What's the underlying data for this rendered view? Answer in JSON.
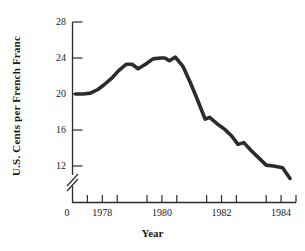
{
  "chart_data": {
    "type": "line",
    "title": "",
    "subtitle": "",
    "xlabel": "Year",
    "ylabel": "U.S. Cents per French Franc",
    "grid": false,
    "legend": null,
    "axis_break": true,
    "axis_break_note": "y-axis broken between 0 and 12",
    "xlim": [
      1977.0,
      1984.5
    ],
    "ylim": [
      10.0,
      28.0
    ],
    "y_ticks": [
      28,
      24,
      20,
      16,
      12
    ],
    "y_tick_labels": [
      "28",
      "24",
      "20",
      "16",
      "12"
    ],
    "x_origin_label": "0",
    "x_ticks": [
      1978,
      1980,
      1982,
      1984
    ],
    "x_tick_labels": [
      "1978",
      "1980",
      "1982",
      "1984"
    ],
    "x_minor_ticks": [
      1977.5,
      1978.5,
      1979.5,
      1980.5,
      1981.5,
      1982.5,
      1983.5,
      1984.5
    ],
    "series": [
      {
        "name": "U.S. cents per French franc",
        "color": "#2b2b2b",
        "x": [
          1977.1,
          1977.35,
          1977.6,
          1977.85,
          1978.05,
          1978.3,
          1978.55,
          1978.8,
          1979.0,
          1979.2,
          1979.45,
          1979.7,
          1979.95,
          1980.1,
          1980.25,
          1980.45,
          1980.7,
          1980.95,
          1981.2,
          1981.45,
          1981.6,
          1981.85,
          1982.1,
          1982.35,
          1982.55,
          1982.75,
          1983.0,
          1983.25,
          1983.5,
          1983.75,
          1984.05,
          1984.3
        ],
        "y": [
          20.0,
          20.0,
          20.1,
          20.5,
          21.0,
          21.7,
          22.6,
          23.3,
          23.3,
          22.8,
          23.3,
          23.9,
          24.0,
          24.0,
          23.7,
          24.1,
          23.1,
          21.3,
          19.3,
          17.2,
          17.4,
          16.7,
          16.1,
          15.3,
          14.4,
          14.6,
          13.7,
          12.9,
          12.1,
          12.0,
          11.8,
          10.6
        ]
      }
    ]
  },
  "axes": {
    "y_label_text": "U.S. Cents per French Franc",
    "x_label_text": "Year",
    "origin_label": "0"
  }
}
